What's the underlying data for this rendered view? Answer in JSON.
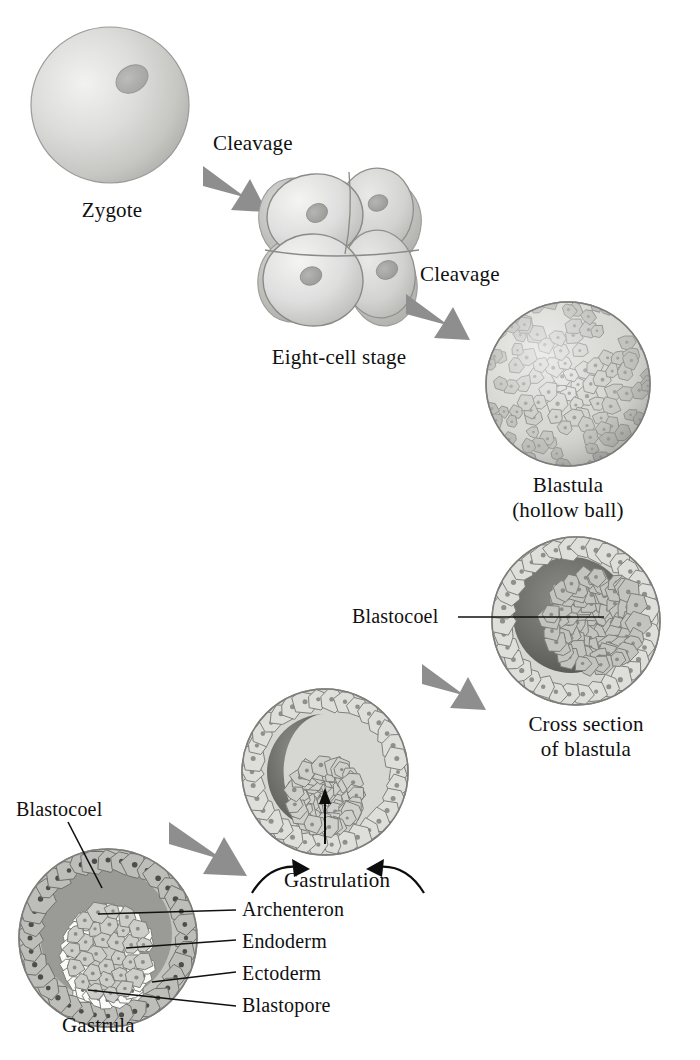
{
  "figure": {
    "background_color": "#ffffff",
    "arrow_color": "#8e8e8e",
    "text_color": "#101010",
    "leader_line_color": "#111111"
  },
  "stages": [
    {
      "id": "zygote",
      "label": "Zygote",
      "sublabel": "",
      "cell_count": 1,
      "cell_fill": "#d8d8d6",
      "nucleus_fill": "#b3b3b1"
    },
    {
      "id": "eight-cell-stage",
      "label": "Eight-cell stage",
      "sublabel": "",
      "cell_count": 8,
      "cell_fill": "#d9d9d7",
      "nucleus_fill": "#aeaeac"
    },
    {
      "id": "blastula",
      "label": "Blastula",
      "sublabel": "(hollow ball)",
      "cell_fill": "#cfcfcb",
      "nucleus_fill": "#9c9c99"
    },
    {
      "id": "cross-section-of-blastula",
      "label": "Cross section",
      "sublabel": "of blastula",
      "cell_fill": "#d2d2ce",
      "cavity_fill": "#6f6f6c",
      "nucleus_fill": "#9a9a97"
    },
    {
      "id": "gastrulating-embryo",
      "label": "",
      "sublabel": "",
      "cell_fill": "#d2d2ce",
      "cavity_fill": "#6f6f6c"
    },
    {
      "id": "gastrula",
      "label": "Gastrula",
      "sublabel": "",
      "cell_fill": "#b8b8b4",
      "cavity_fill": "#8d8d8a",
      "endoderm_fill": "#f7f7f5",
      "archenteron_fill": "#c9c9c5"
    }
  ],
  "process_arrows": [
    {
      "id": "cleavage-1",
      "label": "Cleavage",
      "direction": "down-right"
    },
    {
      "id": "cleavage-2",
      "label": "Cleavage",
      "direction": "down-right"
    },
    {
      "id": "to-gastrulation",
      "label": "",
      "direction": "down-left"
    },
    {
      "id": "to-gastrula",
      "label": "",
      "direction": "down-left"
    }
  ],
  "gastrulation": {
    "label": "Gastrulation",
    "arrow_count": 2
  },
  "callouts": [
    {
      "id": "blastocoel-blastula",
      "label": "Blastocoel",
      "target": "cross-section-of-blastula"
    },
    {
      "id": "blastocoel-gastrula",
      "label": "Blastocoel",
      "target": "gastrula"
    },
    {
      "id": "archenteron",
      "label": "Archenteron",
      "target": "gastrula"
    },
    {
      "id": "endoderm",
      "label": "Endoderm",
      "target": "gastrula"
    },
    {
      "id": "ectoderm",
      "label": "Ectoderm",
      "target": "gastrula"
    },
    {
      "id": "blastopore",
      "label": "Blastopore",
      "target": "gastrula"
    }
  ]
}
